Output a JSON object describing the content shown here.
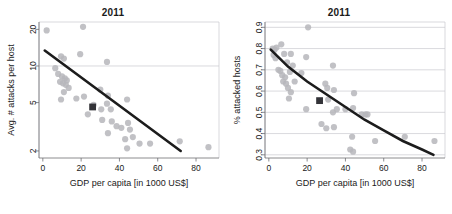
{
  "figure": {
    "background": "#ffffff",
    "point_color": "#b6b6bb",
    "line_color": "#1c1c1c",
    "marker_color": "#333338",
    "grid_color": "#c8c8cf"
  },
  "panels": [
    {
      "id": "left",
      "title": "2011",
      "xlabel": "GDP per capita [in 1000 US$]",
      "ylabel": "Avg. # attacks per host"
    },
    {
      "id": "right",
      "title": "2011",
      "xlabel": "GDP per capita [in 1000 US$]",
      "ylabel": "% attacked hosts"
    }
  ],
  "chart_data": [
    {
      "type": "scatter",
      "panel": "left",
      "title": "2011",
      "xlabel": "GDP per capita [in 1000 US$]",
      "ylabel": "Avg. # attacks per host",
      "xlim": [
        -2,
        92
      ],
      "ylim": [
        1.75,
        23
      ],
      "yscale": "log",
      "xscale": "linear",
      "grid": true,
      "gridlines_y": [
        10
      ],
      "xticks": [
        0,
        20,
        40,
        60,
        80
      ],
      "xticklabels": [
        "0",
        "20",
        "40",
        "60",
        "80"
      ],
      "yticks": [
        2,
        5,
        10,
        20
      ],
      "yticklabels": [
        "2",
        "5",
        "10",
        "20"
      ],
      "legend": null,
      "series": [
        {
          "name": "countries",
          "marker": "circle",
          "color": "#b6b6bb",
          "points": [
            [
              2.0,
              19.6
            ],
            [
              21.0,
              21.0
            ],
            [
              9.5,
              12.0
            ],
            [
              11.0,
              11.5
            ],
            [
              19.5,
              12.5
            ],
            [
              33.5,
              10.8
            ],
            [
              6.5,
              9.6
            ],
            [
              8.0,
              8.6
            ],
            [
              10.0,
              8.2
            ],
            [
              11.5,
              7.9
            ],
            [
              12.5,
              7.6
            ],
            [
              9.0,
              7.4
            ],
            [
              10.5,
              7.2
            ],
            [
              12.0,
              7.0
            ],
            [
              13.5,
              6.6
            ],
            [
              11.0,
              6.1
            ],
            [
              9.5,
              5.3
            ],
            [
              17.5,
              5.4
            ],
            [
              21.5,
              5.6
            ],
            [
              30.0,
              6.4
            ],
            [
              34.0,
              5.7
            ],
            [
              44.0,
              5.3
            ],
            [
              26.5,
              4.8
            ],
            [
              23.5,
              4.0
            ],
            [
              30.5,
              4.4
            ],
            [
              33.5,
              4.9
            ],
            [
              35.5,
              4.4
            ],
            [
              31.0,
              3.6
            ],
            [
              36.0,
              3.5
            ],
            [
              38.5,
              3.2
            ],
            [
              34.0,
              2.8
            ],
            [
              41.0,
              3.1
            ],
            [
              44.5,
              3.4
            ],
            [
              45.5,
              3.0
            ],
            [
              43.0,
              2.5
            ],
            [
              47.0,
              2.6
            ],
            [
              44.0,
              2.1
            ],
            [
              50.5,
              2.3
            ],
            [
              56.0,
              2.3
            ],
            [
              71.5,
              2.4
            ],
            [
              86.5,
              2.15
            ]
          ]
        }
      ],
      "trend_line": {
        "name": "log-linear fit",
        "color": "#1c1c1c",
        "points": [
          [
            1.0,
            13.4
          ],
          [
            72.0,
            2.0
          ]
        ]
      },
      "highlight_point": {
        "name": "aggregate marker",
        "marker": "square",
        "color": "#333338",
        "point": [
          26.0,
          4.6
        ]
      }
    },
    {
      "type": "scatter",
      "panel": "right",
      "title": "2011",
      "xlabel": "GDP per capita [in 1000 US$]",
      "ylabel": "% attacked hosts",
      "xlim": [
        -2,
        92
      ],
      "ylim": [
        0.285,
        0.925
      ],
      "yscale": "linear",
      "xscale": "linear",
      "grid": true,
      "gridlines_y": [
        0.3,
        0.4,
        0.5,
        0.6,
        0.7,
        0.8,
        0.9
      ],
      "xticks": [
        0,
        20,
        40,
        60,
        80
      ],
      "xticklabels": [
        "0",
        "20",
        "40",
        "60",
        "80"
      ],
      "yticks": [
        0.3,
        0.4,
        0.5,
        0.6,
        0.7,
        0.8,
        0.9
      ],
      "yticklabels": [
        "0.3",
        "0.4",
        "0.5",
        "0.6",
        "0.7",
        "0.8",
        "0.9"
      ],
      "legend": null,
      "series": [
        {
          "name": "countries",
          "marker": "circle",
          "color": "#b6b6bb",
          "points": [
            [
              20.5,
              0.9
            ],
            [
              2.0,
              0.8
            ],
            [
              3.0,
              0.795
            ],
            [
              4.0,
              0.805
            ],
            [
              6.5,
              0.82
            ],
            [
              2.5,
              0.77
            ],
            [
              3.5,
              0.755
            ],
            [
              8.0,
              0.775
            ],
            [
              11.5,
              0.775
            ],
            [
              19.5,
              0.76
            ],
            [
              9.5,
              0.735
            ],
            [
              12.5,
              0.72
            ],
            [
              5.0,
              0.7
            ],
            [
              6.0,
              0.695
            ],
            [
              33.5,
              0.72
            ],
            [
              7.0,
              0.675
            ],
            [
              8.5,
              0.665
            ],
            [
              11.0,
              0.69
            ],
            [
              17.0,
              0.685
            ],
            [
              7.5,
              0.645
            ],
            [
              9.0,
              0.635
            ],
            [
              13.5,
              0.645
            ],
            [
              10.0,
              0.615
            ],
            [
              29.5,
              0.635
            ],
            [
              11.5,
              0.595
            ],
            [
              30.5,
              0.615
            ],
            [
              34.0,
              0.605
            ],
            [
              10.5,
              0.565
            ],
            [
              44.5,
              0.59
            ],
            [
              31.0,
              0.56
            ],
            [
              19.5,
              0.515
            ],
            [
              33.5,
              0.5
            ],
            [
              35.5,
              0.515
            ],
            [
              40.0,
              0.515
            ],
            [
              44.0,
              0.52
            ],
            [
              48.5,
              0.49
            ],
            [
              50.5,
              0.49
            ],
            [
              51.5,
              0.49
            ],
            [
              27.5,
              0.445
            ],
            [
              34.0,
              0.43
            ],
            [
              30.0,
              0.425
            ],
            [
              43.5,
              0.385
            ],
            [
              55.5,
              0.365
            ],
            [
              71.0,
              0.385
            ],
            [
              86.5,
              0.365
            ],
            [
              42.5,
              0.325
            ],
            [
              44.0,
              0.315
            ]
          ]
        }
      ],
      "trend_line": {
        "name": "exponential decay fit",
        "color": "#1c1c1c",
        "points": [
          [
            1.0,
            0.795
          ],
          [
            10.0,
            0.715
          ],
          [
            20.0,
            0.645
          ],
          [
            30.0,
            0.585
          ],
          [
            40.0,
            0.525
          ],
          [
            50.0,
            0.465
          ],
          [
            60.0,
            0.415
          ],
          [
            70.0,
            0.365
          ],
          [
            80.0,
            0.325
          ],
          [
            86.0,
            0.3
          ]
        ]
      },
      "highlight_point": {
        "name": "aggregate marker",
        "marker": "square",
        "color": "#333338",
        "point": [
          26.5,
          0.555
        ]
      }
    }
  ]
}
